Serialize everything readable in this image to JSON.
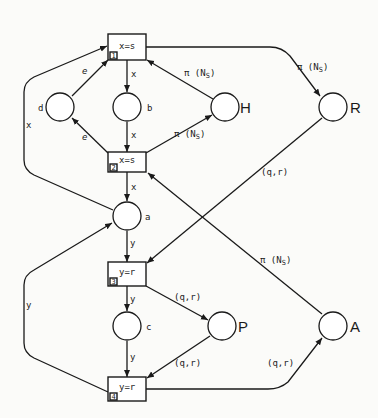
{
  "diagram": {
    "type": "petri-net",
    "colors": {
      "ink": "#1a1a1a",
      "paper": "#fbfbf9"
    },
    "transitions": [
      {
        "id": "t1",
        "number": "1",
        "guard": "x=s"
      },
      {
        "id": "t2",
        "number": "2",
        "guard": "x=s"
      },
      {
        "id": "t3",
        "number": "3",
        "guard": "y=r"
      },
      {
        "id": "t4",
        "number": "4",
        "guard": "y=r"
      }
    ],
    "places": [
      {
        "id": "d",
        "label": "d"
      },
      {
        "id": "b",
        "label": "b"
      },
      {
        "id": "H",
        "label": "H"
      },
      {
        "id": "R",
        "label": "R"
      },
      {
        "id": "a",
        "label": "a"
      },
      {
        "id": "c",
        "label": "c"
      },
      {
        "id": "P",
        "label": "P"
      },
      {
        "id": "A",
        "label": "A"
      }
    ],
    "arcs": [
      {
        "from": "a",
        "to": "t1",
        "label": "x"
      },
      {
        "from": "d",
        "to": "t1",
        "label": "e"
      },
      {
        "from": "t1",
        "to": "b",
        "label": "x"
      },
      {
        "from": "b",
        "to": "t2",
        "label": "x"
      },
      {
        "from": "t2",
        "to": "d",
        "label": "e"
      },
      {
        "from": "H",
        "to": "t1",
        "label": "π(N_S)"
      },
      {
        "from": "t2",
        "to": "H",
        "label": "π(N_S)"
      },
      {
        "from": "t1",
        "to": "R",
        "label": "π(N_S)"
      },
      {
        "from": "t2",
        "to": "a",
        "label": "x"
      },
      {
        "from": "a",
        "to": "t3",
        "label": "y"
      },
      {
        "from": "t4",
        "to": "a",
        "label": "y"
      },
      {
        "from": "t3",
        "to": "c",
        "label": "y"
      },
      {
        "from": "c",
        "to": "t4",
        "label": "y"
      },
      {
        "from": "t3",
        "to": "P",
        "label": "(q,r)"
      },
      {
        "from": "P",
        "to": "t4",
        "label": "(q,r)"
      },
      {
        "from": "t4",
        "to": "A",
        "label": "(q,r)"
      },
      {
        "from": "R",
        "to": "t3",
        "label": "(q,r)"
      },
      {
        "from": "A",
        "to": "t2",
        "label": "π(N_S)"
      }
    ],
    "labels": {
      "x": "x",
      "y": "y",
      "e": "e",
      "pi": "π (N",
      "pi_sub": "S",
      "pi_close": ")",
      "qr": "(q,r)"
    }
  }
}
